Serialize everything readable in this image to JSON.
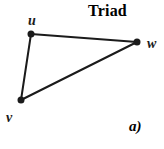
{
  "title": "Triad",
  "caption": "a)",
  "colors": {
    "ink": "#1b1b1b",
    "background": "#ffffff"
  },
  "graph": {
    "node_radius": 3.5,
    "edge_width": 2,
    "nodes": [
      {
        "id": "u",
        "label": "u",
        "x": 31,
        "y": 34,
        "label_x": 32,
        "label_y": 25,
        "label_anchor": "middle"
      },
      {
        "id": "w",
        "label": "w",
        "x": 137,
        "y": 42,
        "label_x": 147,
        "label_y": 48,
        "label_anchor": "start"
      },
      {
        "id": "v",
        "label": "v",
        "x": 21,
        "y": 100,
        "label_x": 6,
        "label_y": 122,
        "label_anchor": "start"
      }
    ],
    "edges": [
      [
        "u",
        "w"
      ],
      [
        "u",
        "v"
      ],
      [
        "v",
        "w"
      ]
    ]
  }
}
